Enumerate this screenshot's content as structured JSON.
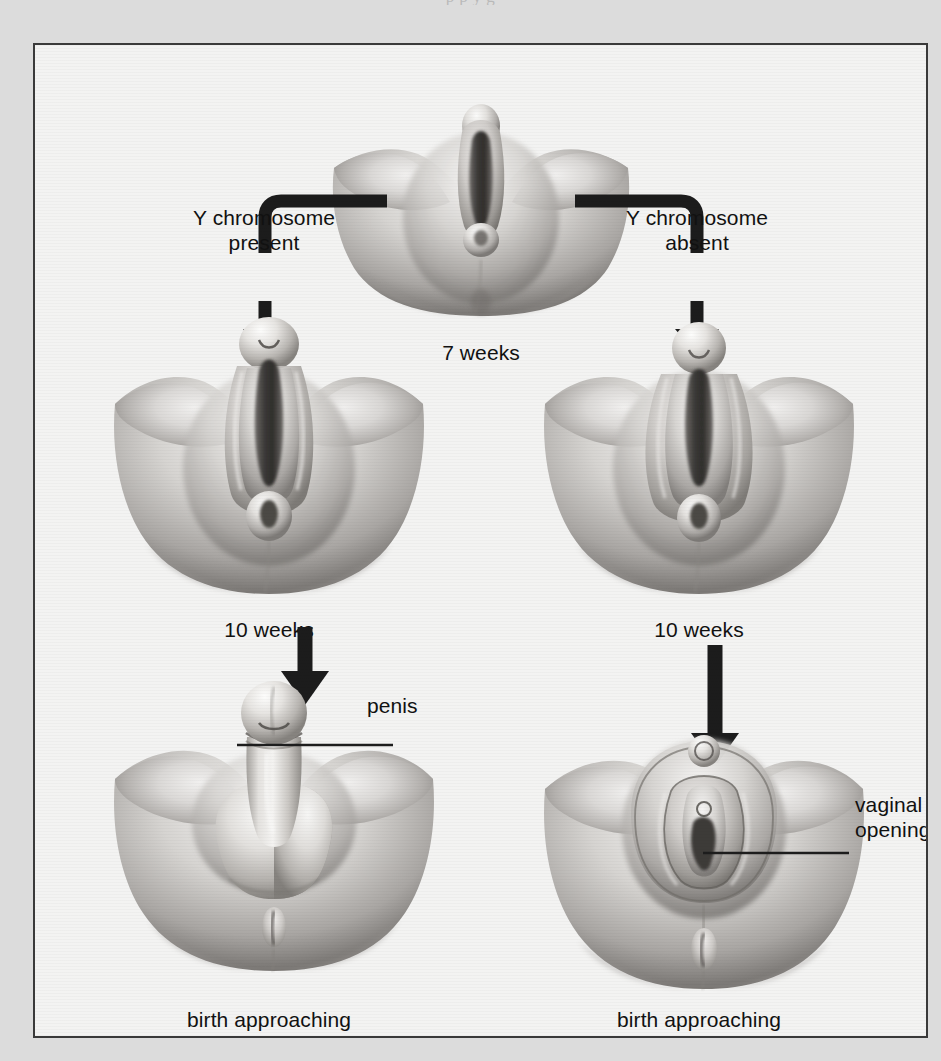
{
  "page": {
    "top_bleed_text": "p       p         y                                                 g"
  },
  "figure": {
    "stages": [
      {
        "id": "indifferent",
        "caption": "7 weeks",
        "figure_name": "indifferent-genitalia-7-weeks"
      },
      {
        "id": "male-10-weeks",
        "caption": "10 weeks",
        "figure_name": "male-genitalia-10-weeks"
      },
      {
        "id": "female-10-weeks",
        "caption": "10 weeks",
        "figure_name": "female-genitalia-10-weeks"
      },
      {
        "id": "male-birth",
        "caption": "birth approaching",
        "figure_name": "male-genitalia-birth"
      },
      {
        "id": "female-birth",
        "caption": "birth approaching",
        "figure_name": "female-genitalia-birth"
      }
    ],
    "branches": [
      {
        "id": "male-branch",
        "label": "Y chromosome\npresent"
      },
      {
        "id": "female-branch",
        "label": "Y chromosome\nabsent"
      }
    ],
    "callouts": [
      {
        "id": "penis",
        "label": "penis"
      },
      {
        "id": "vaginal-opening",
        "label": "vaginal\nopening"
      }
    ],
    "colors": {
      "page_background": "#dcdcdc",
      "panel_background": "#f3f3f2",
      "panel_border": "#3a3a3a",
      "text": "#111111",
      "arrow": "#1c1c1c",
      "illustration_light": "#f0efee",
      "illustration_mid": "#b4b2b0",
      "illustration_dark": "#55524f"
    }
  }
}
